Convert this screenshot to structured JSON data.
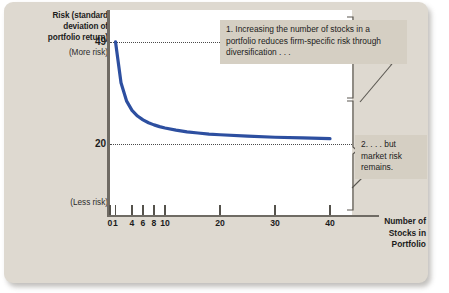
{
  "figure": {
    "background_color": "#ded9d0",
    "plot_background_color": "#ffffff",
    "callout_background_color": "#d5cfc3",
    "curve_color": "#2d4fa0",
    "axis_color": "#6f6b64"
  },
  "axes": {
    "y_title_line1": "Risk (standard",
    "y_title_line2": "deviation of",
    "y_title_line3": "portfolio return)",
    "y_more_risk": "(More risk)",
    "y_less_risk": "(Less risk)",
    "y_tick_high": "49",
    "y_tick_low": "20",
    "x_title_line1": "Number of",
    "x_title_line2": "Stocks in",
    "x_title_line3": "Portfolio"
  },
  "callouts": {
    "one": "1. Increasing the number of stocks in a portfolio reduces firm-specific risk through diversification . . .",
    "two": "2. . . . but market risk remains."
  },
  "chart_data": {
    "type": "line",
    "title": "Risk (standard deviation of portfolio return)",
    "xlabel": "Number of Stocks in Portfolio",
    "ylabel": "Risk (standard deviation of portfolio return)",
    "xlim": [
      0,
      44
    ],
    "ylim": [
      0,
      58
    ],
    "grid": "horizontal dotted reference lines at y = 49 and y = 20",
    "legend": "none",
    "x_tick_labels": [
      "0",
      "1",
      "4",
      "6",
      "8",
      "10",
      "20",
      "30",
      "40"
    ],
    "x_tick_values": [
      0,
      1,
      4,
      6,
      8,
      10,
      20,
      30,
      40
    ],
    "y_tick_labels": [
      "49",
      "20"
    ],
    "y_tick_values": [
      49,
      20
    ],
    "y_axis_annotations": [
      "(More risk)",
      "(Less risk)"
    ],
    "reference_lines": [
      {
        "value": 49,
        "style": "dotted",
        "label": "total risk of a single stock"
      },
      {
        "value": 20,
        "style": "dotted",
        "label": "market risk floor"
      }
    ],
    "series": [
      {
        "name": "Portfolio risk",
        "color": "#2d4fa0",
        "x": [
          1,
          2,
          3,
          4,
          5,
          6,
          7,
          8,
          9,
          10,
          12,
          14,
          16,
          18,
          20,
          25,
          30,
          35,
          40
        ],
        "values": [
          49.0,
          37.4,
          32.3,
          29.6,
          28.0,
          26.9,
          26.1,
          25.5,
          25.0,
          24.6,
          24.0,
          23.5,
          23.2,
          22.9,
          22.7,
          22.3,
          22.0,
          21.8,
          21.6
        ]
      }
    ],
    "annotations": [
      {
        "id": "1",
        "text": "1. Increasing the number of stocks in a portfolio reduces firm-specific risk through diversification . . .",
        "points_to": "upper brace spanning risk from 49 down to 20 (firm-specific risk)"
      },
      {
        "id": "2",
        "text": "2. . . . but market risk remains.",
        "points_to": "lower brace spanning risk from 20 down to 0 (market risk)"
      }
    ]
  }
}
